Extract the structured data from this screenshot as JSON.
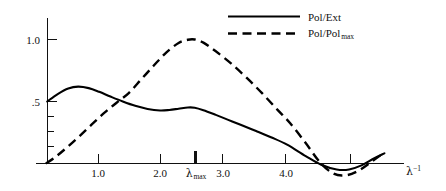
{
  "chart_data": {
    "type": "line",
    "title": "",
    "subtitle": "",
    "xlabel": "λ⁻¹",
    "ylabel": "",
    "xlim": [
      0.0,
      5.85
    ],
    "ylim": [
      -0.15,
      1.12
    ],
    "grid": false,
    "legend_position": "top-right",
    "x_ticks": [
      {
        "value": 1.0,
        "label": "1.0",
        "emphasis": false
      },
      {
        "value": 2.0,
        "label": "2.0",
        "emphasis": false
      },
      {
        "value": 2.56,
        "label": "λ_max",
        "emphasis": true
      },
      {
        "value": 3.0,
        "label": "3.0",
        "emphasis": false
      },
      {
        "value": 4.0,
        "label": "4.0",
        "emphasis": false
      },
      {
        "value": 5.05,
        "label": "",
        "emphasis": false
      }
    ],
    "y_ticks": [
      {
        "value": 1.0,
        "label": "1.0"
      },
      {
        "value": 0.5,
        "label": ".5"
      },
      {
        "value": 0.35,
        "label": ""
      },
      {
        "value": 0.23,
        "label": ""
      },
      {
        "value": 0.11,
        "label": ""
      }
    ],
    "series": [
      {
        "name": "Pol/Ext",
        "style": "solid",
        "color": "#000000",
        "x": [
          0.18,
          0.35,
          0.52,
          0.68,
          0.85,
          1.02,
          1.2,
          1.4,
          1.6,
          1.8,
          2.0,
          2.15,
          2.3,
          2.45,
          2.56,
          2.7,
          2.9,
          3.1,
          3.3,
          3.55,
          3.8,
          4.05,
          4.35,
          4.6,
          4.85,
          5.05,
          5.25,
          5.45,
          5.62
        ],
        "y": [
          0.5,
          0.56,
          0.605,
          0.62,
          0.608,
          0.578,
          0.54,
          0.5,
          0.465,
          0.44,
          0.428,
          0.432,
          0.442,
          0.452,
          0.45,
          0.43,
          0.392,
          0.352,
          0.312,
          0.262,
          0.21,
          0.152,
          0.06,
          -0.01,
          -0.048,
          -0.048,
          -0.015,
          0.04,
          0.082
        ]
      },
      {
        "name": "Pol/Pol_max",
        "style": "dashed",
        "color": "#000000",
        "x": [
          0.16,
          0.32,
          0.5,
          0.7,
          0.9,
          1.1,
          1.3,
          1.5,
          1.7,
          1.9,
          2.1,
          2.3,
          2.45,
          2.56,
          2.7,
          2.9,
          3.15,
          3.4,
          3.65,
          3.9,
          4.1,
          4.35,
          4.58,
          4.8,
          5.0,
          5.2,
          5.4,
          5.58
        ],
        "y": [
          0.0,
          0.055,
          0.13,
          0.22,
          0.315,
          0.408,
          0.49,
          0.57,
          0.68,
          0.79,
          0.895,
          0.972,
          0.998,
          1.0,
          0.975,
          0.905,
          0.805,
          0.69,
          0.565,
          0.43,
          0.325,
          0.165,
          0.01,
          -0.082,
          -0.095,
          -0.058,
          0.01,
          0.075
        ]
      }
    ],
    "legend": [
      {
        "label": "Pol/Ext",
        "style": "solid"
      },
      {
        "label_prefix": "Pol/Pol",
        "label_sub": "max",
        "style": "dashed"
      }
    ],
    "annotations": [
      {
        "text": "λ",
        "sub": "max",
        "x": 2.56,
        "role": "x-tick-marker"
      }
    ]
  },
  "axis": {
    "x_label_base": "λ",
    "x_label_exponent": "−1",
    "lambda_symbol": "λ",
    "lambda_max_sub": "max"
  },
  "ticks": {
    "y": {
      "one": "1.0",
      "half": ".5"
    },
    "x": {
      "one": "1.0",
      "two": "2.0",
      "three": "3.0",
      "four": "4.0"
    }
  },
  "legend": {
    "solid_label": "Pol/Ext",
    "dashed_label_base": "Pol/Pol",
    "dashed_label_sub": "max"
  },
  "colors": {
    "ink": "#000000",
    "axis": "#111111",
    "background": "#ffffff"
  }
}
